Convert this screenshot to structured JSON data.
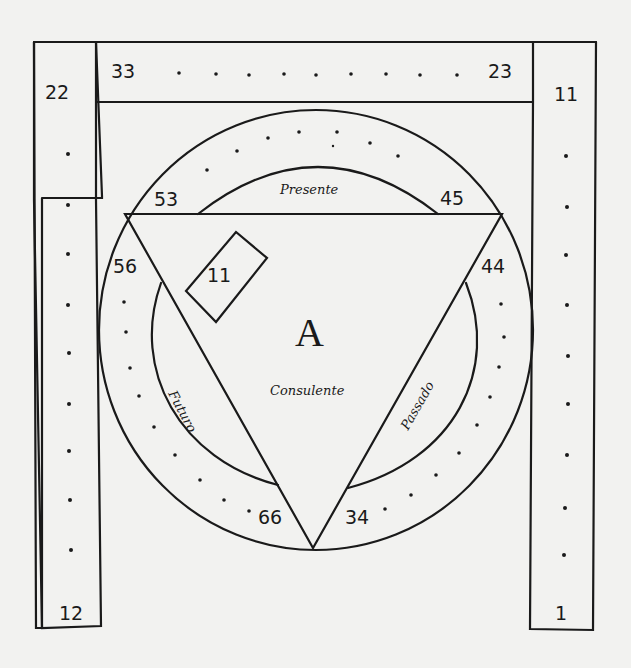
{
  "diagram": {
    "colors": {
      "ink": "#1a1a1a",
      "paper": "#f2f2f0"
    },
    "center_letter": "A",
    "center_label": "Consulente",
    "arc_labels": {
      "top": "Presente",
      "left": "Futuro",
      "right": "Passado"
    },
    "frame_numbers": {
      "top_bar_left": "33",
      "top_bar_right": "23",
      "left_column_top": "22",
      "left_column_bottom": "12",
      "right_column_top": "11",
      "right_column_bottom": "1"
    },
    "triangle_numbers": {
      "top_left": "53",
      "top_right": "45",
      "left_upper": "56",
      "right_upper": "44",
      "bottom_left": "66",
      "bottom_right": "34"
    },
    "inner_box_number": "11"
  }
}
